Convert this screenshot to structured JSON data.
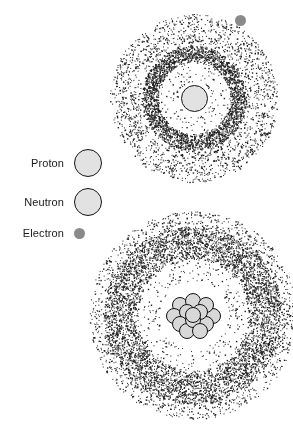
{
  "figure": {
    "background_color": "#ffffff",
    "width": 293,
    "height": 428
  },
  "legend": {
    "items": [
      {
        "label": "Proton",
        "symbol": "filled-outlined-circle",
        "fill_color": "#e2e2e2",
        "stroke_color": "#141414",
        "diameter": 28,
        "x": 76,
        "y": 163
      },
      {
        "label": "Neutron",
        "symbol": "filled-outlined-circle",
        "fill_color": "#e2e2e2",
        "stroke_color": "#141414",
        "diameter": 28,
        "x": 76,
        "y": 202
      },
      {
        "label": "Electron",
        "symbol": "small-gray-dot",
        "fill_color": "#8a8a8a",
        "stroke_color": "none",
        "diameter": 11,
        "x": 72,
        "y": 241
      }
    ]
  },
  "atoms": [
    {
      "name": "hydrogen-atom",
      "center_x": 194,
      "center_y": 98,
      "nucleus": {
        "type": "single-proton",
        "nucleon_count": 1,
        "diameter": 27,
        "fill_color": "#e2e2e2",
        "stroke_color": "#141414"
      },
      "electron_cloud": {
        "type": "stipple",
        "dot_color": "#1f1f1f",
        "shell_radius": 44,
        "shell_width": 17,
        "shell_dots": 3400,
        "halo_inner_radius": 44,
        "halo_outer_radius": 84,
        "halo_dots": 2600,
        "gap_radius": 16
      },
      "free_electron": {
        "label": "Electron",
        "x": 240,
        "y": 20,
        "diameter": 11,
        "color": "#8a8a8a"
      }
    },
    {
      "name": "large-atom",
      "center_x": 193,
      "center_y": 315,
      "nucleus": {
        "type": "nucleon-cluster",
        "nucleon_count": 13,
        "nucleon_diameter": 16,
        "fill_color": "#d8d8d8",
        "stroke_color": "#111111",
        "positions": [
          [
            -13,
            -10
          ],
          [
            0,
            -14
          ],
          [
            13,
            -10
          ],
          [
            -19,
            1
          ],
          [
            -6,
            -3
          ],
          [
            7,
            -3
          ],
          [
            20,
            1
          ],
          [
            -13,
            9
          ],
          [
            0,
            5
          ],
          [
            13,
            9
          ],
          [
            -6,
            16
          ],
          [
            7,
            16
          ],
          [
            0,
            0
          ]
        ]
      },
      "electron_cloud": {
        "type": "stipple",
        "dot_color": "#1f1f1f",
        "shell_radius": 72,
        "shell_width": 34,
        "shell_dots": 6200,
        "halo_inner_radius": 72,
        "halo_outer_radius": 104,
        "halo_dots": 2200,
        "gap_radius": 34
      }
    }
  ]
}
